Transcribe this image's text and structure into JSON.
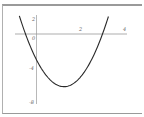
{
  "chart_data": {
    "type": "line",
    "title": "",
    "xlabel": "",
    "ylabel": "",
    "xlim": [
      -1,
      4
    ],
    "ylim": [
      -8,
      2
    ],
    "grid": false,
    "legend": null,
    "x_ticks": [
      "2",
      "4"
    ],
    "y_ticks": [
      "2",
      "0",
      "-4",
      "-8"
    ],
    "series": [
      {
        "name": "f(x) = 2x^2 - 5x - 3",
        "x": [
          -1.0,
          -0.5,
          0,
          0.5,
          1.0,
          1.25,
          1.5,
          2.0,
          2.5,
          3.0,
          3.5
        ],
        "values": [
          4.0,
          0.0,
          -3.0,
          -5.0,
          -6.0,
          -6.125,
          -6.0,
          -5.0,
          -3.0,
          0.0,
          4.0
        ]
      }
    ],
    "colors": {
      "curve": "#2a2a2a",
      "axes": "#8a8a8a",
      "frame": "#9a9a9a"
    }
  },
  "labels": {
    "y_top": "2",
    "y_zero": "0",
    "y_mid": "-4",
    "y_bottom": "-8",
    "x_two": "2",
    "x_four": "4"
  }
}
